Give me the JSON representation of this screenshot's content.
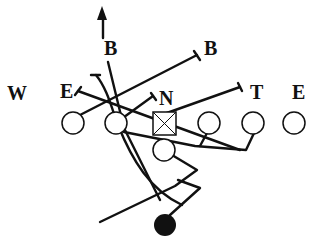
{
  "diagram": {
    "type": "football-play",
    "colors": {
      "ink": "#111111",
      "background": "#ffffff"
    },
    "defense_labels": [
      {
        "id": "B-left",
        "text": "B",
        "x": 111,
        "y": 55
      },
      {
        "id": "B-right",
        "text": "B",
        "x": 205,
        "y": 55
      },
      {
        "id": "W",
        "text": "W",
        "x": 7,
        "y": 100
      },
      {
        "id": "E-left",
        "text": "E",
        "x": 60,
        "y": 98
      },
      {
        "id": "N",
        "text": "N",
        "x": 159,
        "y": 105
      },
      {
        "id": "T",
        "text": "T",
        "x": 250,
        "y": 99
      },
      {
        "id": "E-right",
        "text": "E",
        "x": 292,
        "y": 99
      }
    ],
    "offense": {
      "linemen": [
        {
          "id": "LT",
          "cx": 73,
          "cy": 123
        },
        {
          "id": "LG",
          "cx": 116,
          "cy": 123
        },
        {
          "id": "RG",
          "cx": 209,
          "cy": 123
        },
        {
          "id": "RT",
          "cx": 253,
          "cy": 123
        },
        {
          "id": "TE",
          "cx": 294,
          "cy": 123
        }
      ],
      "center": {
        "id": "C",
        "x": 153,
        "y": 112,
        "size": 23
      },
      "quarterback": {
        "id": "QB",
        "cx": 164,
        "cy": 150
      },
      "running_back": {
        "id": "RB",
        "cx": 165,
        "cy": 225,
        "filled": true
      }
    }
  }
}
